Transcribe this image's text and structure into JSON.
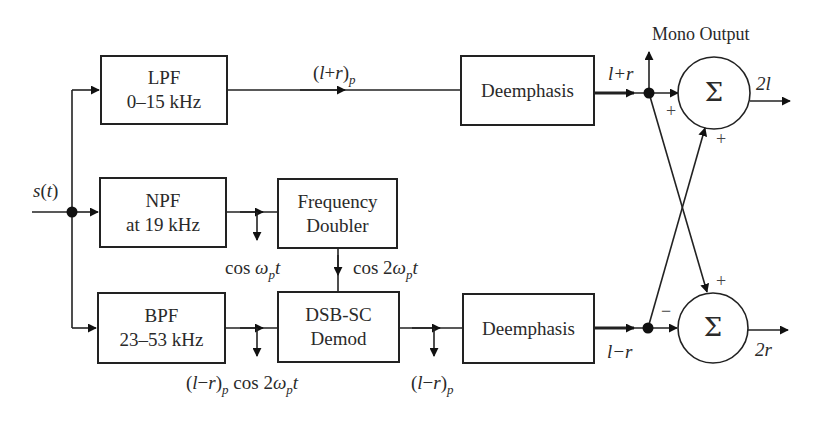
{
  "diagram": {
    "type": "block-diagram",
    "input": {
      "label_fn": "s",
      "label_arg": "t"
    },
    "blocks": [
      {
        "id": "lpf",
        "line1": "LPF",
        "line2": "0–15 kHz"
      },
      {
        "id": "npf",
        "line1": "NPF",
        "line2": "at 19 kHz"
      },
      {
        "id": "bpf",
        "line1": "BPF",
        "line2": "23–53 kHz"
      },
      {
        "id": "doubler",
        "line1": "Frequency",
        "line2": "Doubler"
      },
      {
        "id": "demod",
        "line1": "DSB-SC",
        "line2": "Demod"
      },
      {
        "id": "deemph_top",
        "line1": "Deemphasis"
      },
      {
        "id": "deemph_bottom",
        "line1": "Deemphasis"
      }
    ],
    "summers": [
      {
        "id": "sum_top",
        "symbol": "Σ",
        "sign_direct": "+",
        "sign_cross": "+",
        "output": "2l"
      },
      {
        "id": "sum_bottom",
        "symbol": "Σ",
        "sign_direct": "−",
        "sign_cross": "+",
        "output": "2r"
      }
    ],
    "signals": {
      "lpr_p": {
        "open": "(",
        "a": "l",
        "op": "+",
        "b": "r",
        "close": ")",
        "sub": "p"
      },
      "lpr": "l+r",
      "lmr": "l−r",
      "pilot": {
        "pre": "cos ",
        "w": "ω",
        "sub": "p",
        "t": "t"
      },
      "carrier": {
        "pre": "cos 2",
        "w": "ω",
        "sub": "p",
        "t": "t"
      },
      "lmr_mod": {
        "open": "(",
        "a": "l",
        "op": "−",
        "b": "r",
        "close": ")",
        "sub": "p",
        "post": " cos 2",
        "w": "ω",
        "sub2": "p",
        "t": "t"
      },
      "lmr_p": {
        "open": "(",
        "a": "l",
        "op": "−",
        "b": "r",
        "close": ")",
        "sub": "p"
      }
    },
    "mono_output": "Mono Output",
    "colors": {
      "stroke": "#222222",
      "background": "#ffffff"
    }
  }
}
